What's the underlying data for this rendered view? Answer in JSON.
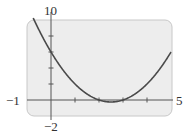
{
  "chart_data": {
    "type": "line",
    "title": "",
    "xlabel": "",
    "ylabel": "",
    "xlim": [
      -1,
      5
    ],
    "ylim": [
      -2,
      10
    ],
    "x_ticks": [
      1,
      2,
      3,
      4
    ],
    "y_ticks": [
      2,
      4,
      6,
      8
    ],
    "grid": false,
    "legend": null,
    "series": [
      {
        "name": "y = x^2 - 5x + 6",
        "x": [
          -0.8,
          -0.5,
          0,
          0.5,
          1,
          1.5,
          2,
          2.5,
          3,
          3.5,
          4,
          4.5,
          5
        ],
        "values": [
          10.64,
          8.75,
          6,
          3.75,
          2,
          0.75,
          0,
          -0.25,
          0,
          0.75,
          2,
          3.75,
          6
        ]
      }
    ],
    "window_labels": {
      "xmin": "−1",
      "xmax": "5",
      "ymax": "10",
      "ymin": "−2"
    }
  },
  "colors": {
    "panel_bg": "#ededed",
    "panel_border": "#c8c8c8",
    "curve": "#4a4a4a",
    "axis": "#555555"
  }
}
